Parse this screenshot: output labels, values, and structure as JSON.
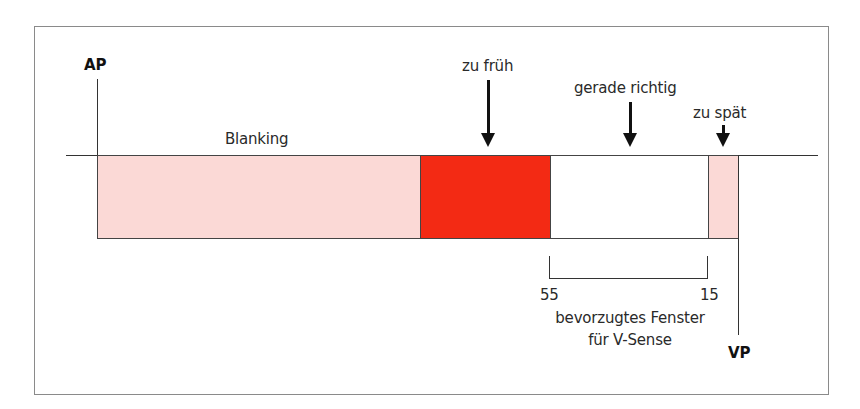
{
  "diagram": {
    "markers": {
      "ap": "AP",
      "vp": "VP"
    },
    "segments": [
      {
        "id": "blanking",
        "label": "Blanking",
        "color": "#fbd9d6"
      },
      {
        "id": "too-early",
        "label": "",
        "color": "#f32a14"
      },
      {
        "id": "preferred",
        "label": "",
        "color": "#ffffff"
      },
      {
        "id": "too-late",
        "label": "",
        "color": "#fbd9d6"
      }
    ],
    "arrows": [
      {
        "id": "too-early",
        "label": "zu früh"
      },
      {
        "id": "just-right",
        "label": "gerade richtig"
      },
      {
        "id": "too-late",
        "label": "zu spät"
      }
    ],
    "window": {
      "start_value": "55",
      "end_value": "15",
      "caption_line1": "bevorzugtes Fenster",
      "caption_line2": "für V-Sense"
    }
  }
}
